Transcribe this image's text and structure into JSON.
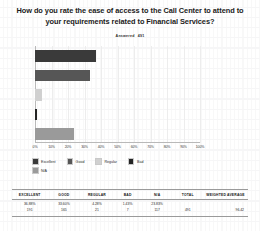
{
  "chart_title": "How do you rate the ease of access to the Call Center to attend to your requirements related to Financial Services?",
  "answered": {
    "label": "Answered",
    "value": "491"
  },
  "chart_data": {
    "type": "bar",
    "orientation": "horizontal",
    "title": "How do you rate the ease of access to the Call Center to attend to your requirements related to Financial Services?",
    "xlabel": "",
    "ylabel": "",
    "xlim": [
      0,
      100
    ],
    "grid": true,
    "legend_position": "bottom",
    "categories": [
      "Excellent",
      "Good",
      "Regular",
      "Bad",
      "N/A"
    ],
    "values": [
      36.88,
      33.6,
      4.28,
      1.43,
      23.83
    ],
    "counts": [
      191,
      165,
      21,
      7,
      117
    ],
    "colors": [
      "#3a3a3a",
      "#565656",
      "#d0d0d0",
      "#242424",
      "#9a9a9a"
    ],
    "tick_labels": [
      "0%",
      "10%",
      "20%",
      "30%",
      "40%",
      "50%",
      "60%",
      "70%",
      "80%",
      "90%",
      "100%"
    ],
    "tick_values": [
      0,
      10,
      20,
      30,
      40,
      50,
      60,
      70,
      80,
      90,
      100
    ],
    "total": 491,
    "weighted_average": "96.42"
  },
  "legend": [
    {
      "label": "Excellent",
      "color": "#3a3a3a"
    },
    {
      "label": "Good",
      "color": "#565656"
    },
    {
      "label": "Regular",
      "color": "#d0d0d0"
    },
    {
      "label": "Bad",
      "color": "#242424"
    },
    {
      "label": "N/A",
      "color": "#9a9a9a"
    }
  ],
  "table": {
    "headers": [
      "EXCELLENT",
      "GOOD",
      "REGULAR",
      "BAD",
      "N/A",
      "TOTAL",
      "WEIGHTED AVERAGE"
    ],
    "rows": [
      {
        "excellent_pct": "36.88%",
        "excellent_count": "191",
        "good_pct": "33.60%",
        "good_count": "165",
        "regular_pct": "4.28%",
        "regular_count": "21",
        "bad_pct": "1.43%",
        "bad_count": "7",
        "na_pct": "23.83%",
        "na_count": "117",
        "total": "491",
        "weighted_average": "96.42"
      }
    ]
  }
}
